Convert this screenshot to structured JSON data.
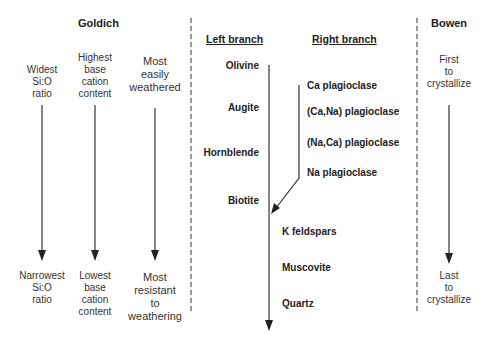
{
  "goldich": {
    "title": "Goldich",
    "columns": [
      {
        "top": "Widest\nSi:O\nratio",
        "bottom": "Narrowest\nSi:O\nratio"
      },
      {
        "top": "Highest\nbase\ncation\ncontent",
        "bottom": "Lowest\nbase\ncation\ncontent"
      },
      {
        "top": "Most\neasily\nweathered",
        "bottom": "Most\nresistant\nto\nweathering"
      }
    ]
  },
  "branches": {
    "left_header": "Left branch",
    "right_header": "Right branch",
    "left": [
      "Olivine",
      "Augite",
      "Hornblende",
      "Biotite"
    ],
    "right": [
      "Ca plagioclase",
      "(Ca,Na) plagioclase",
      "(Na,Ca) plagioclase",
      "Na plagioclase"
    ],
    "common": [
      "K feldspars",
      "Muscovite",
      "Quartz"
    ]
  },
  "bowen": {
    "title": "Bowen",
    "top": "First\nto\ncrystallize",
    "bottom": "Last\nto\ncrystallize"
  },
  "colors": {
    "line": "#333333",
    "text": "#222222"
  }
}
